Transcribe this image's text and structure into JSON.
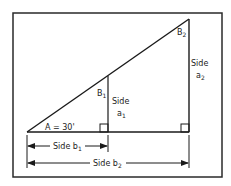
{
  "diagram": {
    "type": "similar right triangles",
    "angle_A_label": "A = 30'",
    "vertex_labels": {
      "B1": {
        "base": "B",
        "sub": "1"
      },
      "B2": {
        "base": "B",
        "sub": "2"
      }
    },
    "side_labels": {
      "a1": {
        "word": "Side",
        "base": "a",
        "sub": "1"
      },
      "a2": {
        "word": "Side",
        "base": "a",
        "sub": "2"
      },
      "b1": {
        "word": "Side",
        "base": "b",
        "sub": "1"
      },
      "b2": {
        "word": "Side",
        "base": "b",
        "sub": "2"
      }
    },
    "colors": {
      "stroke": "#1a1a1a",
      "background": "#ffffff",
      "frame": "#2a2a2a"
    }
  }
}
